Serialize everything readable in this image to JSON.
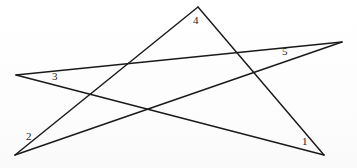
{
  "figure": {
    "background_color": "#fefefe",
    "stroke_color": "#1a1a1a",
    "label_color": "#232323",
    "width": 357,
    "height": 168
  },
  "diagram_data": {
    "type": "line-figure",
    "shape": "pentagram",
    "points": {
      "left": {
        "name": "left-point",
        "x": 16,
        "y": 75
      },
      "top": {
        "name": "top-point",
        "x": 198,
        "y": 7
      },
      "right": {
        "name": "right-point",
        "x": 342,
        "y": 42
      },
      "bottom_left": {
        "name": "bottom-left-point",
        "x": 15,
        "y": 155
      },
      "bottom_right": {
        "name": "bottom-right-point",
        "x": 324,
        "y": 155
      }
    },
    "edges": [
      {
        "name": "edge-left-to-right",
        "from": "left",
        "to": "right",
        "path": "M 16 75 L 342 42"
      },
      {
        "name": "edge-bottomleft-to-top",
        "from": "bottom_left",
        "to": "top",
        "path": "M 15 155 L 198 7"
      },
      {
        "name": "edge-top-to-bottomright",
        "from": "top",
        "to": "bottom_right",
        "path": "M 198 7 L 324 155"
      },
      {
        "name": "edge-bottomright-to-left",
        "from": "bottom_right",
        "to": "left",
        "path": "M 324 155 L 16 75"
      },
      {
        "name": "edge-right-to-bottomleft",
        "from": "right",
        "to": "bottom_left",
        "path": "M 342 42 L 15 155"
      }
    ],
    "intersections": [
      {
        "name": "upper-left-crossing",
        "x": 127,
        "y": 65
      },
      {
        "name": "lower-middle-crossing",
        "x": 149,
        "y": 112
      },
      {
        "name": "upper-right-crossing",
        "x": 255,
        "y": 72
      },
      {
        "name": "left-lower-crossing",
        "x": 90,
        "y": 90
      },
      {
        "name": "right-lower-crossing",
        "x": 249,
        "y": 98
      }
    ],
    "labels": [
      {
        "id": "label-1",
        "text": "1",
        "x": 302,
        "y": 136,
        "at_point": "bottom_right"
      },
      {
        "id": "label-2",
        "text": "2",
        "x": 26,
        "y": 131,
        "at_point": "bottom_left"
      },
      {
        "id": "label-3",
        "text": "3",
        "x": 52,
        "y": 71,
        "at_point": "left"
      },
      {
        "id": "label-4",
        "text": "4",
        "x": 193,
        "y": 15,
        "at_point": "top"
      },
      {
        "id": "label-5",
        "text": "5",
        "x": 282,
        "y": 46,
        "at_point": "right"
      }
    ]
  }
}
